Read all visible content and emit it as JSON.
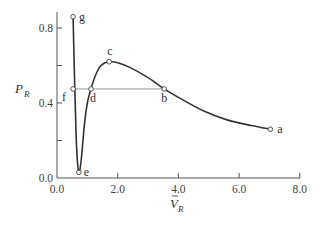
{
  "chart_data": {
    "type": "line",
    "title": "",
    "xlabel": "V̄_R",
    "ylabel": "P_R",
    "xlim": [
      0,
      8
    ],
    "ylim": [
      0,
      0.88
    ],
    "grid": false,
    "legend": null,
    "x_ticks": [
      {
        "value": 0,
        "label": "0.0"
      },
      {
        "value": 2,
        "label": "2.0"
      },
      {
        "value": 4,
        "label": "4.0"
      },
      {
        "value": 6,
        "label": "6.0"
      },
      {
        "value": 8,
        "label": "8.0"
      }
    ],
    "y_ticks": [
      {
        "value": 0,
        "label": "0.0"
      },
      {
        "value": 0.2,
        "label": ""
      },
      {
        "value": 0.4,
        "label": "0.4"
      },
      {
        "value": 0.6,
        "label": ""
      },
      {
        "value": 0.8,
        "label": "0.8"
      }
    ],
    "series": [
      {
        "name": "isotherm",
        "x": [
          0.53,
          0.56,
          0.6,
          0.65,
          0.72,
          0.8,
          0.9,
          1.0,
          1.12,
          1.25,
          1.4,
          1.55,
          1.72,
          2.0,
          2.4,
          3.0,
          3.53,
          4.0,
          4.8,
          5.6,
          6.4,
          7.03
        ],
        "y": [
          0.86,
          0.65,
          0.4,
          0.15,
          0.03,
          0.1,
          0.28,
          0.4,
          0.475,
          0.54,
          0.59,
          0.612,
          0.62,
          0.615,
          0.59,
          0.535,
          0.475,
          0.43,
          0.36,
          0.31,
          0.28,
          0.26
        ]
      }
    ],
    "tie_line": {
      "y": 0.475,
      "x_start": 0.53,
      "x_end": 3.53
    },
    "points": [
      {
        "label": "a",
        "x": 7.03,
        "y": 0.26
      },
      {
        "label": "b",
        "x": 3.53,
        "y": 0.475
      },
      {
        "label": "c",
        "x": 1.72,
        "y": 0.62
      },
      {
        "label": "d",
        "x": 1.12,
        "y": 0.475
      },
      {
        "label": "e",
        "x": 0.72,
        "y": 0.03
      },
      {
        "label": "f",
        "x": 0.53,
        "y": 0.475
      },
      {
        "label": "g",
        "x": 0.53,
        "y": 0.86
      }
    ],
    "axis_labels": {
      "y_main": "P",
      "y_sub": "R",
      "x_main": "V",
      "x_bar": "–",
      "x_sub": "R"
    }
  }
}
